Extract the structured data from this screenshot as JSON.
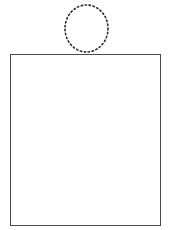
{
  "canvas": {
    "width": 171,
    "height": 230,
    "background": "#ffffff"
  },
  "figure": {
    "circle": {
      "name": "dotted-circle",
      "center_x": 86.5,
      "center_y": 28.5,
      "radius_x": 21.5,
      "radius_y": 23.5,
      "stroke": "#2b2b2b",
      "stroke_width": 1.6,
      "dash": "1.4 2.6",
      "fill": "none"
    },
    "rectangle": {
      "name": "grid-rectangle",
      "x": 10.5,
      "y": 54.5,
      "width": 150,
      "height": 171,
      "stroke": "#4a4a4a",
      "stroke_width": 1,
      "fill": "#ffffff"
    },
    "grid": {
      "name": "dotted-grid",
      "columns": 3,
      "rows": 3,
      "stroke": "#9a9a9a",
      "stroke_width": 1,
      "dash": "1 1.6",
      "vertical_lines_x": [
        61,
        111
      ],
      "horizontal_lines_y": [
        111,
        168
      ]
    }
  },
  "colors": {
    "ink": "#2b2b2b",
    "frame": "#4a4a4a",
    "grid": "#9a9a9a",
    "paper": "#ffffff"
  }
}
